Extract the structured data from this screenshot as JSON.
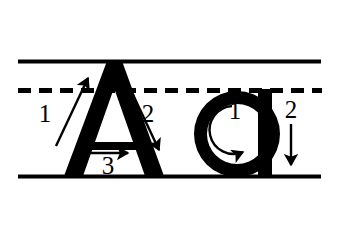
{
  "worksheet": {
    "title": "Letter A a stroke order handwriting guide",
    "background_color": "#ffffff",
    "ink_color": "#000000",
    "guide_lines": {
      "top_line": {
        "name": "ascender-line",
        "style": "solid",
        "y": 61,
        "x_start": 18,
        "x_end": 321,
        "thickness": 4
      },
      "middle_line": {
        "name": "x-height-line",
        "style": "dashed",
        "y": 90,
        "x_start": 18,
        "x_end": 322,
        "thickness": 5,
        "dash": 13,
        "gap": 8
      },
      "bottom_line": {
        "name": "baseline",
        "style": "solid",
        "y": 176,
        "x_start": 18,
        "x_end": 321,
        "thickness": 4
      }
    },
    "letters": [
      {
        "id": "uppercase-a",
        "glyph": "A",
        "case": "uppercase",
        "strokes": [
          {
            "number": "1",
            "label_x": 52,
            "label_y": 122,
            "direction": "up-right",
            "description": "left diagonal upward to apex"
          },
          {
            "number": "2",
            "label_x": 148,
            "label_y": 122,
            "direction": "down-right",
            "description": "right diagonal down from apex"
          },
          {
            "number": "3",
            "label_x": 104,
            "label_y": 172,
            "direction": "right",
            "description": "horizontal crossbar left to right"
          }
        ]
      },
      {
        "id": "lowercase-a",
        "glyph": "a",
        "case": "lowercase",
        "strokes": [
          {
            "number": "1",
            "label_x": 232,
            "label_y": 123,
            "direction": "counter-clockwise",
            "description": "round the bowl counter-clockwise"
          },
          {
            "number": "2",
            "label_x": 287,
            "label_y": 118,
            "direction": "down",
            "description": "straight stem downward"
          }
        ]
      }
    ]
  }
}
